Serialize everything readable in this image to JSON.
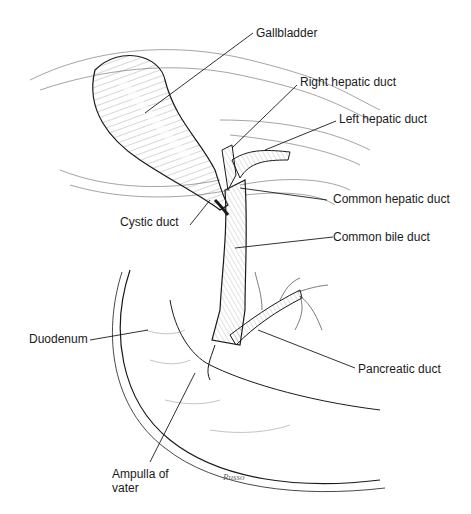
{
  "figure": {
    "labels": {
      "gallbladder": "Gallbladder",
      "right_hepatic_duct": "Right hepatic duct",
      "left_hepatic_duct": "Left hepatic duct",
      "common_hepatic_duct": "Common hepatic duct",
      "cystic_duct": "Cystic duct",
      "common_bile_duct": "Common bile duct",
      "duodenum": "Duodenum",
      "pancreatic_duct": "Pancreatic duct",
      "ampulla_line1": "Ampulla of",
      "ampulla_line2": "vater"
    },
    "signature": "Russo",
    "colors": {
      "ink": "#1a1a1a",
      "hatch": "#555555",
      "background": "#ffffff"
    }
  }
}
